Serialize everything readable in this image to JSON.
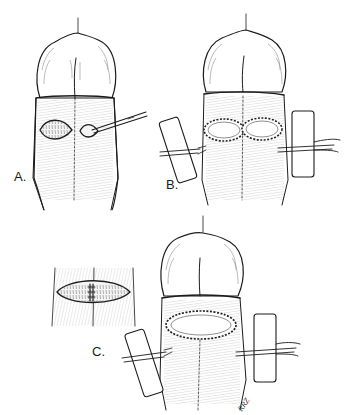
{
  "figure": {
    "background": "#ffffff",
    "ink_color": "#1c1c1c",
    "panels": [
      {
        "id": "A",
        "label": "A.",
        "content": "two elliptical incisions side by side, forceps inserted into right incision"
      },
      {
        "id": "B",
        "label": "B.",
        "content": "two sutured oval wound margins with flat drains placed on left and right"
      },
      {
        "id": "C",
        "label": "C.",
        "content": "single large sutured oval wound with two drains; inset showing bridged incision"
      }
    ],
    "signature": "RRZ"
  }
}
